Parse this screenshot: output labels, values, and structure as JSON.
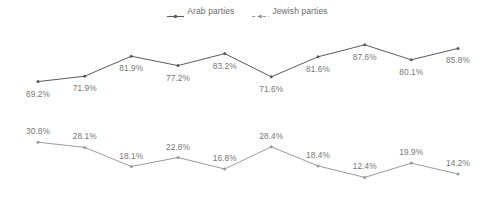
{
  "legend": {
    "position": "top-center",
    "entries": [
      {
        "label": "Arab parties",
        "key": "arab",
        "marker": "line-marker-solid",
        "color": "#5a5a5a"
      },
      {
        "label": "Jewish parties",
        "key": "jewish",
        "marker": "line-marker-dashed",
        "color": "#9a9a9a"
      }
    ]
  },
  "chart_data": {
    "type": "line",
    "title": "",
    "subtitle": "",
    "xlabel": "",
    "ylabel": "",
    "grid": false,
    "axes_visible": false,
    "tick_labels": [],
    "legend_position": "top-center",
    "categories": [
      "1",
      "2",
      "3",
      "4",
      "5",
      "6",
      "7",
      "8",
      "9",
      "10"
    ],
    "series": [
      {
        "name": "Arab parties",
        "color": "#5a5a5a",
        "line_style": "solid",
        "values": [
          69.2,
          71.9,
          81.9,
          77.2,
          83.2,
          71.6,
          81.6,
          87.6,
          80.1,
          85.8
        ],
        "labels": [
          "69.2%",
          "71.9%",
          "81.9%",
          "77.2%",
          "83.2%",
          "71.6%",
          "81.6%",
          "87.6%",
          "80.1%",
          "85.8%"
        ],
        "label_positions": [
          "below",
          "below",
          "below",
          "below",
          "below",
          "below",
          "below",
          "below",
          "below",
          "below"
        ],
        "ylim": [
          65,
          92
        ]
      },
      {
        "name": "Jewish parties",
        "color": "#9a9a9a",
        "line_style": "solid",
        "values": [
          30.8,
          28.1,
          18.1,
          22.8,
          16.8,
          28.4,
          18.4,
          12.4,
          19.9,
          14.2
        ],
        "labels": [
          "30.8%",
          "28.1%",
          "18.1%",
          "22.8%",
          "16.8%",
          "28.4%",
          "18.4%",
          "12.4%",
          "19.9%",
          "14.2%"
        ],
        "label_positions": [
          "above",
          "above",
          "above",
          "above",
          "above",
          "above",
          "above",
          "above",
          "above",
          "above"
        ],
        "ylim": [
          10,
          33
        ]
      }
    ]
  }
}
